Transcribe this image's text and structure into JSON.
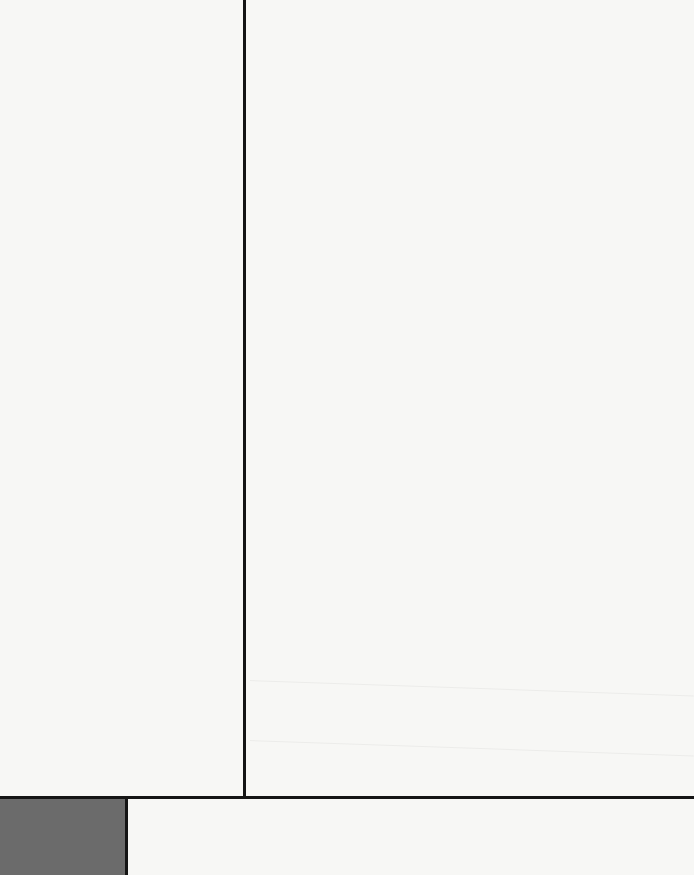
{
  "artwork": {
    "style": "geometric abstract composition",
    "colors": {
      "background": "#f7f7f5",
      "lines": "#151515",
      "block": "#6b6b6b"
    },
    "elements": [
      {
        "type": "vertical-line",
        "x": 243,
        "y_start": 0,
        "y_end": 799
      },
      {
        "type": "horizontal-line",
        "y": 796,
        "x_start": 0,
        "x_end": 694
      },
      {
        "type": "vertical-line",
        "x": 125,
        "y_start": 796,
        "y_end": 875
      },
      {
        "type": "filled-block",
        "x": 0,
        "y": 799,
        "width": 125,
        "height": 76,
        "color": "#6b6b6b"
      }
    ]
  }
}
